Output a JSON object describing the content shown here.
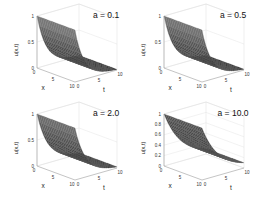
{
  "chart_data": [
    {
      "type": "surface",
      "title": "a = 0.1",
      "xlabel": "x",
      "ylabel": "t",
      "zlabel": "u(x,t)",
      "xlim": [
        0,
        10
      ],
      "ylim": [
        0,
        10
      ],
      "zlim": [
        0,
        1
      ],
      "xticks": [
        "0",
        "5",
        "10"
      ],
      "yticks": [
        "0",
        "5",
        "10"
      ],
      "zticks": [
        "0",
        "0.5",
        "1"
      ],
      "grid": true,
      "description": "Surface decays from u=1 at t=0 toward ~0 as t increases; nearly constant along x",
      "a": 0.1
    },
    {
      "type": "surface",
      "title": "a = 0.5",
      "xlabel": "x",
      "ylabel": "t",
      "zlabel": "u(x,t)",
      "xlim": [
        0,
        10
      ],
      "ylim": [
        0,
        10
      ],
      "zlim": [
        0,
        1
      ],
      "xticks": [
        "0",
        "5",
        "10"
      ],
      "yticks": [
        "0",
        "5",
        "10"
      ],
      "zticks": [
        "0",
        "0.5",
        "1"
      ],
      "grid": true,
      "description": "Surface decays from u=1 at t=0 toward ~0 as t increases",
      "a": 0.5
    },
    {
      "type": "surface",
      "title": "a = 2.0",
      "xlabel": "x",
      "ylabel": "t",
      "zlabel": "u(x,t)",
      "xlim": [
        0,
        10
      ],
      "ylim": [
        0,
        10
      ],
      "zlim": [
        0,
        1
      ],
      "xticks": [
        "0",
        "5",
        "10"
      ],
      "yticks": [
        "0",
        "5",
        "10"
      ],
      "zticks": [
        "0",
        "0.5",
        "1"
      ],
      "grid": true,
      "description": "Surface decays from u=1 at t=0 toward ~0 as t increases",
      "a": 2.0
    },
    {
      "type": "surface",
      "title": "a = 10.0",
      "xlabel": "x",
      "ylabel": "t",
      "zlabel": "u(x,t)",
      "xlim": [
        0,
        10
      ],
      "ylim": [
        0,
        10
      ],
      "zlim": [
        0,
        1
      ],
      "xticks": [
        "0",
        "5",
        "10"
      ],
      "yticks": [
        "0",
        "5",
        "10"
      ],
      "zticks": [
        "0",
        "0.2",
        "0.4",
        "0.6",
        "0.8",
        "1"
      ],
      "grid": true,
      "description": "Surface decays from u=1 at t=0 toward ~0.1 at t=10",
      "a": 10.0
    }
  ],
  "panels": [
    {
      "title": "a = 0.1",
      "xlabel": "x",
      "tlabel": "t",
      "zlabel": "u(x,t)",
      "x0": "0",
      "x5": "5",
      "x10": "10",
      "t0": "0",
      "t5": "5",
      "t10": "10",
      "z": [
        "0",
        "0.5",
        "1"
      ]
    },
    {
      "title": "a = 0.5",
      "xlabel": "x",
      "tlabel": "t",
      "zlabel": "u(x,t)",
      "x0": "0",
      "x5": "5",
      "x10": "10",
      "t0": "0",
      "t5": "5",
      "t10": "10",
      "z": [
        "0",
        "0.5",
        "1"
      ]
    },
    {
      "title": "a = 2.0",
      "xlabel": "x",
      "tlabel": "t",
      "zlabel": "u(x,t)",
      "x0": "0",
      "x5": "5",
      "x10": "10",
      "t0": "0",
      "t5": "5",
      "t10": "10",
      "z": [
        "0",
        "0.5",
        "1"
      ]
    },
    {
      "title": "a = 10.0",
      "xlabel": "x",
      "tlabel": "t",
      "zlabel": "u(x,t)",
      "x0": "0",
      "x5": "5",
      "x10": "10",
      "t0": "0",
      "t5": "5",
      "t10": "10",
      "z": [
        "0",
        "0.2",
        "0.4",
        "0.6",
        "0.8",
        "1"
      ]
    }
  ],
  "colors": {
    "surface_dark": "#1e1e1e",
    "surface_light": "#9a9a9a",
    "mesh": "#5a5a5a",
    "axes": "#888888",
    "grid": "#dddddd"
  }
}
